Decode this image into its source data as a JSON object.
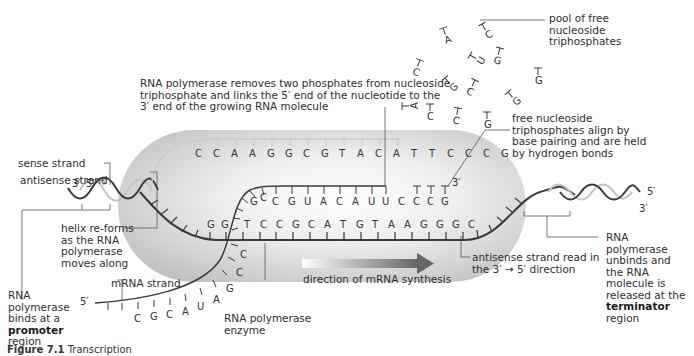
{
  "figure": {
    "caption_number": "Figure 7.1",
    "caption_title": "Transcription"
  },
  "labels": {
    "sense_strand": "sense strand",
    "antisense_strand": "antisense strand",
    "polymerase_removes": [
      "RNA polymerase removes two phosphates from nucleoside",
      "triphosphate and links the 5′ end of the nucleotide to the",
      "3′ end of the growing RNA molecule"
    ],
    "pool": [
      "pool of free",
      "nucleoside",
      "triphosphates"
    ],
    "free_align": [
      "free nucleoside",
      "triphosphates align by",
      "base pairing and are held",
      "by hydrogen bonds"
    ],
    "helix_reforms": [
      "helix re-forms",
      "as the RNA",
      "polymerase",
      "moves along"
    ],
    "mrna_strand": "mRNA strand",
    "rna_polymerase_enzyme": [
      "RNA polymerase",
      "enzyme"
    ],
    "direction": "direction of mRNA synthesis",
    "antisense_read": [
      "antisense strand read in",
      "the 3′ → 5′ direction"
    ],
    "promoter": {
      "lines": [
        "RNA",
        "polymerase",
        "binds at a"
      ],
      "bold": "promoter",
      "tail": "region"
    },
    "terminator": {
      "lines": [
        "RNA",
        "polymerase",
        "unbinds and",
        "the RNA",
        "molecule is",
        "released at the"
      ],
      "bold": "terminator",
      "tail": "region"
    }
  },
  "ends": {
    "left_3": "3′",
    "left_5": "5′",
    "right_5": "5′",
    "right_3": "3′",
    "rna_3": "3′",
    "mrna_5": "5′"
  },
  "sequences": {
    "sense_top": [
      "C",
      "C",
      "A",
      "A",
      "G",
      "G",
      "C",
      "G",
      "T",
      "A",
      "C",
      "A",
      "T",
      "T",
      "C",
      "C",
      "C",
      "G"
    ],
    "rna_growing": [
      "G",
      "C",
      "C",
      "G",
      "U",
      "A",
      "C",
      "A",
      "U",
      "U",
      "C"
    ],
    "rna_aligning": [
      "C",
      "C",
      "G"
    ],
    "antisense_left": [
      "G",
      "G"
    ],
    "antisense_main": [
      "T",
      "C",
      "C",
      "G",
      "C",
      "A",
      "T",
      "G",
      "T",
      "A",
      "A",
      "G",
      "G",
      "G",
      "C"
    ],
    "mrna_tail": [
      "C",
      "C",
      "G",
      "A",
      "U",
      "A",
      "C",
      "G",
      "C"
    ]
  },
  "free_nucleotides": [
    {
      "base": "A",
      "x": 443,
      "y": 28,
      "rot": -20
    },
    {
      "base": "C",
      "x": 482,
      "y": 24,
      "rot": -30
    },
    {
      "base": "U",
      "x": 470,
      "y": 55,
      "rot": -60
    },
    {
      "base": "G",
      "x": 500,
      "y": 48,
      "rot": 15
    },
    {
      "base": "C",
      "x": 420,
      "y": 60,
      "rot": 20
    },
    {
      "base": "G",
      "x": 538,
      "y": 68,
      "rot": 0
    },
    {
      "base": "G",
      "x": 445,
      "y": 78,
      "rot": -40
    },
    {
      "base": "C",
      "x": 475,
      "y": 80,
      "rot": 25
    },
    {
      "base": "G",
      "x": 508,
      "y": 92,
      "rot": -40
    },
    {
      "base": "A",
      "x": 402,
      "y": 106,
      "rot": -90
    },
    {
      "base": "C",
      "x": 430,
      "y": 104,
      "rot": 0
    },
    {
      "base": "C",
      "x": 458,
      "y": 108,
      "rot": 10
    },
    {
      "base": "G",
      "x": 487,
      "y": 112,
      "rot": 0
    }
  ],
  "colors": {
    "capsule_light": "#f4f4f4",
    "capsule_dark": "#bdbdbd",
    "strand": "#3a3a3a",
    "strand_light": "#b8b8b8",
    "arrow_start": "#ffffff",
    "arrow_end": "#666666",
    "leader": "#555555"
  }
}
